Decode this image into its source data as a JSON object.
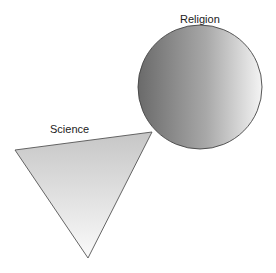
{
  "diagram": {
    "labels": {
      "religion": "Religion",
      "science": "Science"
    },
    "shapes": {
      "religion": {
        "type": "circle",
        "cx": 200,
        "cy": 87,
        "r": 62,
        "fill_dark": "#6e6e6e",
        "fill_light": "#f2f2f2",
        "stroke": "#444444"
      },
      "science": {
        "type": "triangle",
        "points": "15,150 152,132 88,258",
        "fill_top": "#c9c9c9",
        "fill_bottom": "#f7f7f7",
        "stroke": "#555555"
      }
    }
  }
}
